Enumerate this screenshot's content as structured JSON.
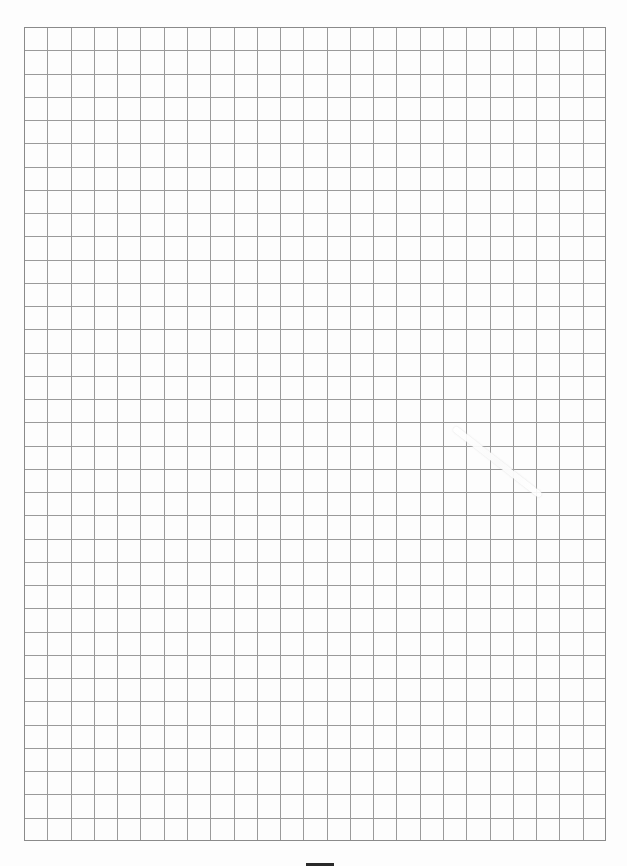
{
  "sheet": {
    "type": "grid-paper",
    "background": "#fdfdfd",
    "line_color": "#9a9a9a",
    "border_color": "#8a8a8a"
  },
  "grid": {
    "left": 24,
    "top": 27,
    "right": 606,
    "bottom": 841,
    "columns": 25,
    "rows": 35
  },
  "smudge": {
    "x": 454,
    "y": 425,
    "length": 110,
    "angle_deg": 38
  },
  "bottom_bar": {
    "x": 306,
    "y": 863,
    "width": 28
  }
}
